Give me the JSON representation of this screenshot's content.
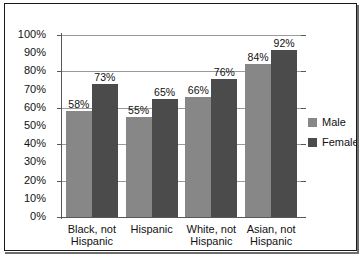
{
  "chart_data": {
    "type": "bar",
    "title": "",
    "xlabel": "",
    "ylabel": "",
    "ylim": [
      0,
      100
    ],
    "grid": true,
    "legend_position": "right",
    "categories": [
      "Black, not Hispanic",
      "Hispanic",
      "White, not Hispanic",
      "Asian, not Hispanic"
    ],
    "category_lines": [
      [
        "Black, not",
        "Hispanic"
      ],
      [
        "Hispanic",
        ""
      ],
      [
        "White, not",
        "Hispanic"
      ],
      [
        "Asian, not",
        "Hispanic"
      ]
    ],
    "series": [
      {
        "name": "Male",
        "color": "#878787",
        "values": [
          58,
          55,
          66,
          84
        ],
        "labels": [
          "58%",
          "55%",
          "66%",
          "84%"
        ]
      },
      {
        "name": "Female",
        "color": "#4b4b4b",
        "values": [
          73,
          65,
          76,
          92
        ],
        "labels": [
          "73%",
          "65%",
          "76%",
          "92%"
        ]
      }
    ],
    "y_ticks": [
      0,
      10,
      20,
      30,
      40,
      50,
      60,
      70,
      80,
      90,
      100
    ],
    "y_tick_labels": [
      "0%",
      "10%",
      "20%",
      "30%",
      "40%",
      "50%",
      "60%",
      "70%",
      "80%",
      "90%",
      "100%"
    ],
    "gridline_values": [
      20,
      40,
      60,
      80,
      100
    ],
    "tick_mark_values": [
      0,
      20,
      40,
      60,
      80,
      100
    ]
  },
  "legend": {
    "items": [
      {
        "label": "Male"
      },
      {
        "label": "Female"
      }
    ]
  },
  "colors": {
    "male": "#878787",
    "female": "#4b4b4b",
    "gridline": "#9a9a9a",
    "axis": "#595959",
    "frame": "#1a1a1a",
    "text": "#111111"
  }
}
